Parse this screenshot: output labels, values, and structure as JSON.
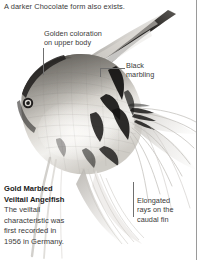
{
  "page": {
    "intro_text": "A darker Chocolate form also exists.",
    "column_rule_color": "#9a9a9a",
    "background_color": "#ffffff",
    "text_color": "#3a3a3a"
  },
  "callouts": [
    {
      "id": "golden",
      "line1": "Golden coloration",
      "line2": "on upper body"
    },
    {
      "id": "black",
      "line1": "Black",
      "line2": "marbling"
    },
    {
      "id": "rays",
      "line1": "Elongated",
      "line2": "rays on the",
      "line3": "caudal fin"
    }
  ],
  "caption": {
    "title_line1": "Gold Marbled",
    "title_line2": "Veiltail Angelfish",
    "body_line1": "The veiltail",
    "body_line2": "characteristic was",
    "body_line3": "first recorded in",
    "body_line4": "1956 in Germany."
  },
  "photo": {
    "subject": "Gold Marbled Veiltail Angelfish",
    "body_light": "#e9e7e2",
    "body_mid": "#b7b4ae",
    "body_dark": "#4a4845",
    "marbling_black": "#141312",
    "fin_pale": "#f2f1ef"
  }
}
